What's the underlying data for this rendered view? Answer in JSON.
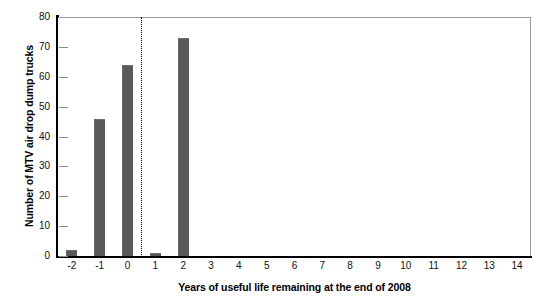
{
  "chart_data": {
    "type": "bar",
    "title": "",
    "xlabel": "Years of useful life remaining at the end of 2008",
    "ylabel": "Number of MTV air drop dump trucks",
    "categories": [
      "-2",
      "-1",
      "0",
      "1",
      "2",
      "3",
      "4",
      "5",
      "6",
      "7",
      "8",
      "9",
      "10",
      "11",
      "12",
      "13",
      "14"
    ],
    "values": [
      2,
      46,
      64,
      1,
      73,
      0,
      0,
      0,
      0,
      0,
      0,
      0,
      0,
      0,
      0,
      0,
      0
    ],
    "ylim": [
      0,
      80
    ],
    "yticks": [
      0,
      10,
      20,
      30,
      40,
      50,
      60,
      70,
      80
    ],
    "ytick_labels": [
      "0",
      "10",
      "20",
      "30",
      "40",
      "50",
      "60",
      "70",
      "80"
    ],
    "grid": false,
    "legend": null,
    "bar_color": "#595959",
    "annotations": [
      {
        "name": "reference-line",
        "type": "vertical-dotted-line",
        "x_value": 0.5,
        "style": "dotted",
        "color": "#000000"
      }
    ]
  }
}
